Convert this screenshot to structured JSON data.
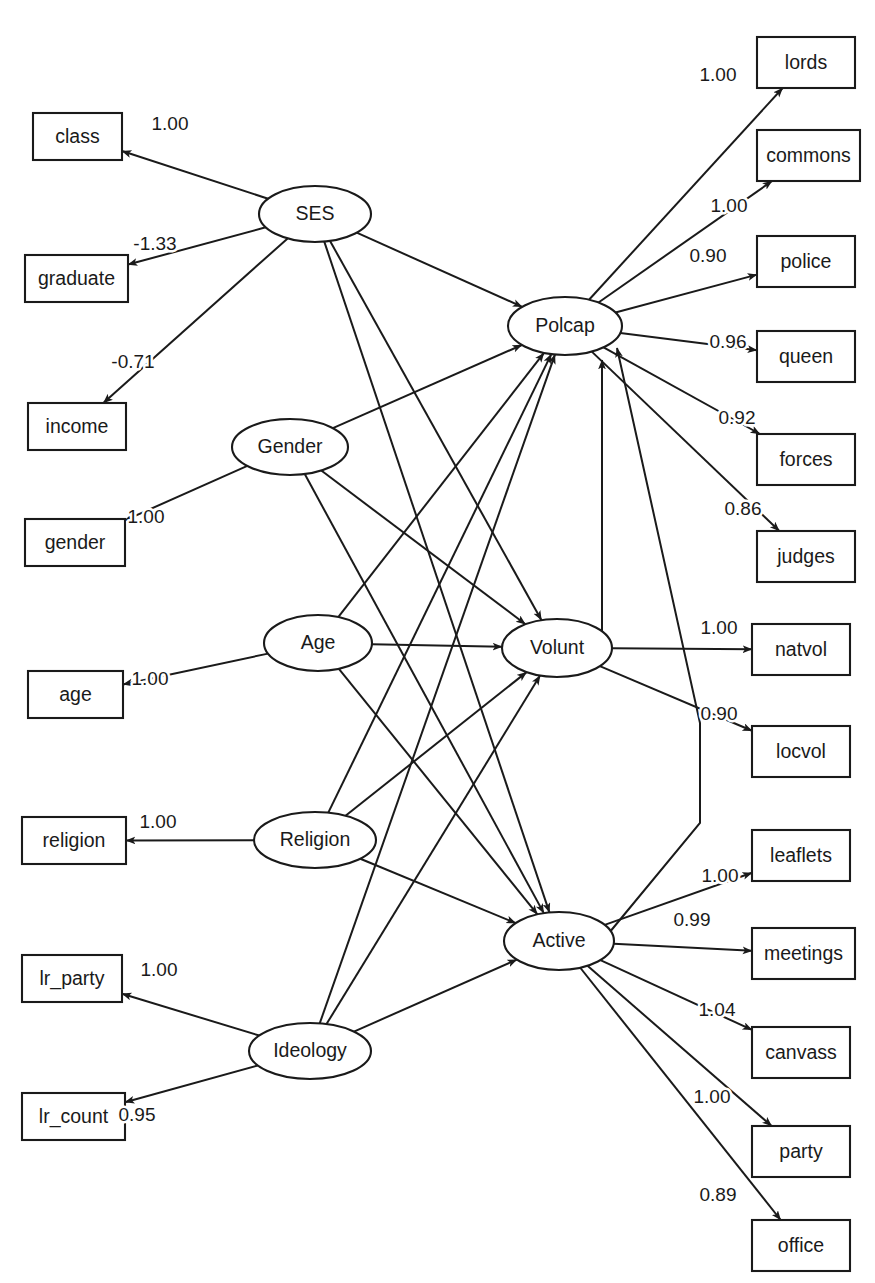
{
  "diagram": {
    "type": "structural-equation-model-path-diagram",
    "background_color": "#ffffff",
    "stroke_color": "#1a1a1a"
  },
  "chart_data": {
    "type": "diagram",
    "title": "",
    "latent_variables": [
      {
        "id": "SES",
        "label": "SES",
        "cx": 315,
        "cy": 214,
        "rx": 56,
        "ry": 28
      },
      {
        "id": "Gender",
        "label": "Gender",
        "cx": 290,
        "cy": 447,
        "rx": 58,
        "ry": 28
      },
      {
        "id": "Age",
        "label": "Age",
        "cx": 318,
        "cy": 643,
        "rx": 54,
        "ry": 28
      },
      {
        "id": "Religion",
        "label": "Religion",
        "cx": 315,
        "cy": 840,
        "rx": 61,
        "ry": 28
      },
      {
        "id": "Ideology",
        "label": "Ideology",
        "cx": 310,
        "cy": 1051,
        "rx": 61,
        "ry": 28
      },
      {
        "id": "Polcap",
        "label": "Polcap",
        "cx": 565,
        "cy": 326,
        "rx": 57,
        "ry": 29
      },
      {
        "id": "Volunt",
        "label": "Volunt",
        "cx": 557,
        "cy": 648,
        "rx": 55,
        "ry": 29
      },
      {
        "id": "Active",
        "label": "Active",
        "cx": 559,
        "cy": 941,
        "rx": 55,
        "ry": 29
      }
    ],
    "observed_variables": [
      {
        "id": "class",
        "label": "class",
        "x": 33,
        "y": 113,
        "w": 89,
        "h": 47
      },
      {
        "id": "graduate",
        "label": "graduate",
        "x": 25,
        "y": 255,
        "w": 103,
        "h": 47
      },
      {
        "id": "income",
        "label": "income",
        "x": 28,
        "y": 403,
        "w": 98,
        "h": 47
      },
      {
        "id": "gender",
        "label": "gender",
        "x": 25,
        "y": 519,
        "w": 100,
        "h": 47
      },
      {
        "id": "age",
        "label": "age",
        "x": 28,
        "y": 671,
        "w": 95,
        "h": 47
      },
      {
        "id": "religion",
        "label": "religion",
        "x": 22,
        "y": 817,
        "w": 104,
        "h": 47
      },
      {
        "id": "lr_party",
        "label": "lr_party",
        "x": 22,
        "y": 955,
        "w": 100,
        "h": 47
      },
      {
        "id": "lr_count",
        "label": "lr_count",
        "x": 22,
        "y": 1093,
        "w": 103,
        "h": 47
      },
      {
        "id": "lords",
        "label": "lords",
        "x": 757,
        "y": 37,
        "w": 98,
        "h": 51
      },
      {
        "id": "commons",
        "label": "commons",
        "x": 757,
        "y": 130,
        "w": 103,
        "h": 51
      },
      {
        "id": "police",
        "label": "police",
        "x": 757,
        "y": 236,
        "w": 98,
        "h": 51
      },
      {
        "id": "queen",
        "label": "queen",
        "x": 757,
        "y": 331,
        "w": 98,
        "h": 51
      },
      {
        "id": "forces",
        "label": "forces",
        "x": 757,
        "y": 434,
        "w": 98,
        "h": 51
      },
      {
        "id": "judges",
        "label": "judges",
        "x": 757,
        "y": 531,
        "w": 98,
        "h": 51
      },
      {
        "id": "natvol",
        "label": "natvol",
        "x": 752,
        "y": 624,
        "w": 98,
        "h": 51
      },
      {
        "id": "locvol",
        "label": "locvol",
        "x": 752,
        "y": 726,
        "w": 98,
        "h": 51
      },
      {
        "id": "leaflets",
        "label": "leaflets",
        "x": 752,
        "y": 830,
        "w": 98,
        "h": 51
      },
      {
        "id": "meetings",
        "label": "meetings",
        "x": 752,
        "y": 928,
        "w": 103,
        "h": 51
      },
      {
        "id": "canvass",
        "label": "canvass",
        "x": 752,
        "y": 1027,
        "w": 98,
        "h": 51
      },
      {
        "id": "party",
        "label": "party",
        "x": 752,
        "y": 1126,
        "w": 98,
        "h": 51
      },
      {
        "id": "office",
        "label": "office",
        "x": 752,
        "y": 1220,
        "w": 98,
        "h": 51
      }
    ],
    "measurement_paths": [
      {
        "from": "SES",
        "to": "class",
        "coefficient": "1.00",
        "label_x": 170,
        "label_y": 125
      },
      {
        "from": "SES",
        "to": "graduate",
        "coefficient": "-1.33",
        "label_x": 155,
        "label_y": 245
      },
      {
        "from": "SES",
        "to": "income",
        "coefficient": "-0.71",
        "label_x": 133,
        "label_y": 363
      },
      {
        "from": "Gender",
        "to": "gender",
        "coefficient": "1.00",
        "label_x": 146,
        "label_y": 518
      },
      {
        "from": "Age",
        "to": "age",
        "coefficient": "1.00",
        "label_x": 150,
        "label_y": 680
      },
      {
        "from": "Religion",
        "to": "religion",
        "coefficient": "1.00",
        "label_x": 158,
        "label_y": 823
      },
      {
        "from": "Ideology",
        "to": "lr_party",
        "coefficient": "1.00",
        "label_x": 159,
        "label_y": 971
      },
      {
        "from": "Ideology",
        "to": "lr_count",
        "coefficient": "0.95",
        "label_x": 137,
        "label_y": 1116
      },
      {
        "from": "Polcap",
        "to": "lords",
        "coefficient": "1.00",
        "label_x": 718,
        "label_y": 76
      },
      {
        "from": "Polcap",
        "to": "commons",
        "coefficient": "1.00",
        "label_x": 729,
        "label_y": 207
      },
      {
        "from": "Polcap",
        "to": "police",
        "coefficient": "0.90",
        "label_x": 708,
        "label_y": 257
      },
      {
        "from": "Polcap",
        "to": "queen",
        "coefficient": "0.96",
        "label_x": 728,
        "label_y": 343
      },
      {
        "from": "Polcap",
        "to": "forces",
        "coefficient": "0.92",
        "label_x": 737,
        "label_y": 419
      },
      {
        "from": "Polcap",
        "to": "judges",
        "coefficient": "0.86",
        "label_x": 743,
        "label_y": 510
      },
      {
        "from": "Volunt",
        "to": "natvol",
        "coefficient": "1.00",
        "label_x": 719,
        "label_y": 629
      },
      {
        "from": "Volunt",
        "to": "locvol",
        "coefficient": "0.90",
        "label_x": 719,
        "label_y": 715
      },
      {
        "from": "Active",
        "to": "leaflets",
        "coefficient": "1.00",
        "label_x": 720,
        "label_y": 877
      },
      {
        "from": "Active",
        "to": "meetings",
        "coefficient": "0.99",
        "label_x": 692,
        "label_y": 921
      },
      {
        "from": "Active",
        "to": "canvass",
        "coefficient": "1.04",
        "label_x": 717,
        "label_y": 1011
      },
      {
        "from": "Active",
        "to": "party",
        "coefficient": "1.00",
        "label_x": 712,
        "label_y": 1098
      },
      {
        "from": "Active",
        "to": "office",
        "coefficient": "0.89",
        "label_x": 718,
        "label_y": 1196
      }
    ],
    "structural_paths": [
      {
        "from": "SES",
        "to": "Polcap"
      },
      {
        "from": "SES",
        "to": "Volunt"
      },
      {
        "from": "SES",
        "to": "Active"
      },
      {
        "from": "Gender",
        "to": "Polcap"
      },
      {
        "from": "Gender",
        "to": "Volunt"
      },
      {
        "from": "Gender",
        "to": "Active"
      },
      {
        "from": "Age",
        "to": "Polcap"
      },
      {
        "from": "Age",
        "to": "Volunt"
      },
      {
        "from": "Age",
        "to": "Active"
      },
      {
        "from": "Religion",
        "to": "Polcap"
      },
      {
        "from": "Religion",
        "to": "Volunt"
      },
      {
        "from": "Religion",
        "to": "Active"
      },
      {
        "from": "Ideology",
        "to": "Polcap"
      },
      {
        "from": "Ideology",
        "to": "Volunt"
      },
      {
        "from": "Ideology",
        "to": "Active"
      },
      {
        "from": "Volunt",
        "to": "Polcap"
      },
      {
        "from": "Active",
        "to": "Polcap"
      }
    ]
  }
}
